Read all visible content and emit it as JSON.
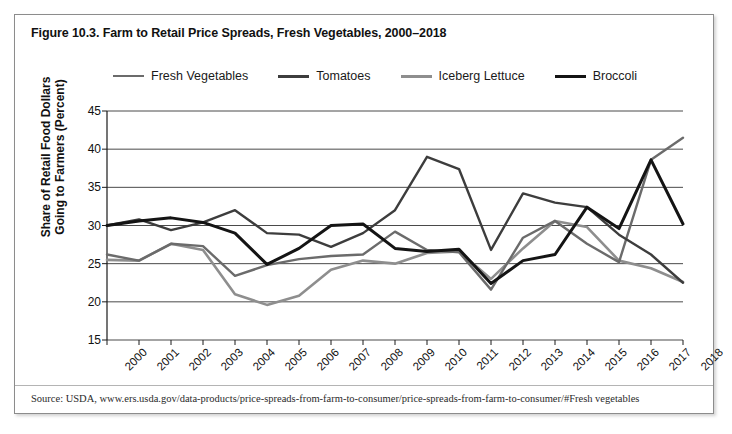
{
  "figure": {
    "title": "Figure 10.3. Farm to Retail Price Spreads, Fresh Vegetables, 2000–2018",
    "source": "Source: USDA, www.ers.usda.gov/data-products/price-spreads-from-farm-to-consumer/price-spreads-from-farm-to-consumer/#Fresh vegetables"
  },
  "colors": {
    "fresh_vegetables": "#6b6b6b",
    "tomatoes": "#3d3d3d",
    "iceberg_lettuce": "#8e8e8e",
    "broccoli": "#141414",
    "axis": "#1a1a1a",
    "gridline": "#4a4a4a",
    "card_border": "#8c8c8c",
    "background": "#ffffff"
  },
  "chart_data": {
    "type": "line",
    "title": "Figure 10.3. Farm to Retail Price Spreads, Fresh Vegetables, 2000–2018",
    "xlabel": "",
    "ylabel": "Share of Retail Food Dollars Going to Farmers (Percent)",
    "ylabel_line1": "Share of Retail Food Dollars",
    "ylabel_line2": "Going to Farmers (Percent)",
    "x": [
      2000,
      2001,
      2002,
      2003,
      2004,
      2005,
      2006,
      2007,
      2008,
      2009,
      2010,
      2011,
      2012,
      2013,
      2014,
      2015,
      2016,
      2017,
      2018
    ],
    "categories": [
      "2000",
      "2001",
      "2002",
      "2003",
      "2004",
      "2005",
      "2006",
      "2007",
      "2008",
      "2009",
      "2010",
      "2011",
      "2012",
      "2013",
      "2014",
      "2015",
      "2016",
      "2017",
      "2018"
    ],
    "ylim": [
      15,
      45
    ],
    "yticks": [
      15,
      20,
      25,
      30,
      35,
      40,
      45
    ],
    "grid": true,
    "legend_position": "top",
    "series": [
      {
        "name": "Fresh Vegetables",
        "color": "#6b6b6b",
        "width": 2.4,
        "values": [
          26.2,
          25.4,
          27.6,
          27.3,
          23.4,
          24.8,
          25.6,
          26.0,
          26.2,
          29.2,
          26.8,
          26.5,
          21.6,
          28.4,
          30.6,
          27.6,
          25.2,
          38.6,
          41.5
        ]
      },
      {
        "name": "Tomatoes",
        "color": "#3d3d3d",
        "width": 2.4,
        "values": [
          30.0,
          30.8,
          29.4,
          30.4,
          32.0,
          29.0,
          28.8,
          27.2,
          29.0,
          32.0,
          39.0,
          37.4,
          26.8,
          34.2,
          33.0,
          32.4,
          28.8,
          26.2,
          22.5
        ]
      },
      {
        "name": "Iceberg Lettuce",
        "color": "#8e8e8e",
        "width": 2.6,
        "values": [
          25.5,
          25.4,
          27.6,
          26.8,
          21.0,
          19.6,
          20.8,
          24.2,
          25.4,
          25.0,
          26.4,
          26.6,
          23.0,
          27.0,
          30.6,
          29.8,
          25.4,
          24.4,
          22.6
        ]
      },
      {
        "name": "Broccoli",
        "color": "#141414",
        "width": 3.0,
        "values": [
          30.0,
          30.6,
          31.0,
          30.4,
          29.0,
          24.9,
          27.0,
          30.0,
          30.2,
          27.0,
          26.6,
          26.9,
          22.4,
          25.4,
          26.2,
          32.4,
          29.6,
          38.6,
          30.2
        ]
      }
    ]
  },
  "legend": {
    "items": [
      {
        "label": "Fresh Vegetables",
        "color": "#6b6b6b",
        "width": 2.6
      },
      {
        "label": "Tomatoes",
        "color": "#3d3d3d",
        "width": 3.0
      },
      {
        "label": "Iceberg Lettuce",
        "color": "#8e8e8e",
        "width": 3.0
      },
      {
        "label": "Broccoli",
        "color": "#141414",
        "width": 3.4
      }
    ]
  }
}
